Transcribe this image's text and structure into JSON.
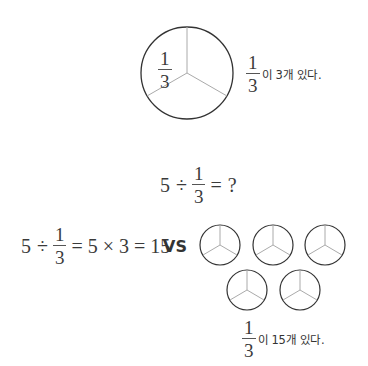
{
  "top_diagram": {
    "circle_label": {
      "numerator": "1",
      "denominator": "3"
    },
    "caption": {
      "numerator": "1",
      "denominator": "3",
      "text": "이 3개 있다."
    }
  },
  "question": {
    "left": "5",
    "op": "÷",
    "fraction": {
      "numerator": "1",
      "denominator": "3"
    },
    "equals": "=",
    "result": "?"
  },
  "comparison": {
    "equation": {
      "left": "5",
      "op": "÷",
      "fraction": {
        "numerator": "1",
        "denominator": "3"
      },
      "rest": "= 5 × 3 = 15"
    },
    "vs_label": "VS",
    "circle_count": 5,
    "caption": {
      "numerator": "1",
      "denominator": "3",
      "text": "이 15개 있다."
    }
  },
  "colors": {
    "circle_stroke": "#333333",
    "divider_stroke": "#aaaaaa",
    "text": "#3a3a3a"
  }
}
